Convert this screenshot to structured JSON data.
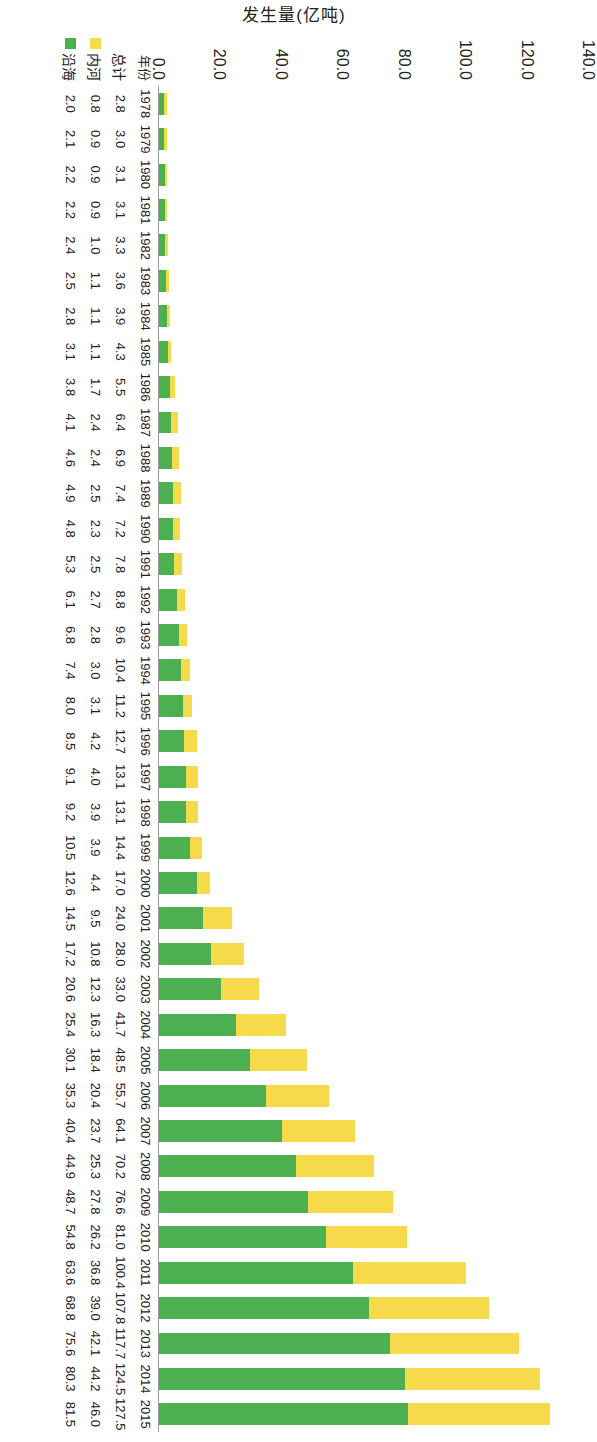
{
  "axis_title": "发生量(亿吨)",
  "y_ticks": [
    "140.0",
    "120.0",
    "100.0",
    "80.0",
    "60.0",
    "40.0",
    "20.0",
    "0.0"
  ],
  "row_labels": {
    "year": "年份",
    "total": "总计",
    "inland": "内河",
    "coastal": "沿海"
  },
  "colors": {
    "inland": "#F7D94C",
    "coastal": "#4CAF50",
    "axis": "#9a9a9a",
    "text": "#222222"
  },
  "chart_data": {
    "type": "bar",
    "title": "",
    "subtitle": "",
    "xlabel": "年份",
    "ylabel": "发生量(亿吨)",
    "ylim": [
      0,
      140
    ],
    "ytick_values": [
      0,
      20,
      40,
      60,
      80,
      100,
      120,
      140
    ],
    "grid": false,
    "stacked": true,
    "orientation": "vertical",
    "legend": [
      "内河",
      "沿海"
    ],
    "legend_position": "bottom-left",
    "categories": [
      "1978",
      "1979",
      "1980",
      "1981",
      "1982",
      "1983",
      "1984",
      "1985",
      "1986",
      "1987",
      "1988",
      "1989",
      "1990",
      "1991",
      "1992",
      "1993",
      "1994",
      "1995",
      "1996",
      "1997",
      "1998",
      "1999",
      "2000",
      "2001",
      "2002",
      "2003",
      "2004",
      "2005",
      "2006",
      "2007",
      "2008",
      "2009",
      "2010",
      "2011",
      "2012",
      "2013",
      "2014",
      "2015"
    ],
    "series": [
      {
        "name": "内河",
        "color": "#F7D94C",
        "values": [
          0.8,
          0.9,
          0.9,
          0.9,
          1.0,
          1.1,
          1.1,
          1.1,
          1.7,
          2.4,
          2.4,
          2.5,
          2.3,
          2.5,
          2.7,
          2.8,
          3.0,
          3.1,
          4.2,
          4.0,
          3.9,
          3.9,
          4.4,
          9.5,
          10.8,
          12.3,
          16.3,
          18.4,
          20.4,
          23.7,
          25.3,
          27.8,
          26.2,
          36.8,
          39.0,
          42.1,
          44.2,
          46.0
        ]
      },
      {
        "name": "沿海",
        "color": "#4CAF50",
        "values": [
          2.0,
          2.1,
          2.2,
          2.2,
          2.4,
          2.5,
          2.8,
          3.1,
          3.8,
          4.1,
          4.6,
          4.9,
          4.8,
          5.3,
          6.1,
          6.8,
          7.4,
          8.0,
          8.5,
          9.1,
          9.2,
          10.5,
          12.6,
          14.5,
          17.2,
          20.6,
          25.4,
          30.1,
          35.3,
          40.4,
          44.9,
          48.7,
          54.8,
          63.6,
          68.8,
          75.6,
          80.3,
          81.5
        ]
      }
    ],
    "totals": [
      2.8,
      3.0,
      3.1,
      3.1,
      3.3,
      3.6,
      3.9,
      4.3,
      5.5,
      6.4,
      6.9,
      7.4,
      7.2,
      7.8,
      8.8,
      9.6,
      10.4,
      11.2,
      12.7,
      13.1,
      13.1,
      14.4,
      17.0,
      24.0,
      28.0,
      33.0,
      41.7,
      48.5,
      55.7,
      64.1,
      70.2,
      76.6,
      81.0,
      100.4,
      107.8,
      117.7,
      124.5,
      127.5
    ],
    "table": {
      "row_headers": [
        "年份",
        "总计",
        "内河",
        "沿海"
      ],
      "rows": [
        [
          "1978",
          "1979",
          "1980",
          "1981",
          "1982",
          "1983",
          "1984",
          "1985",
          "1986",
          "1987",
          "1988",
          "1989",
          "1990",
          "1991",
          "1992",
          "1993",
          "1994",
          "1995",
          "1996",
          "1997",
          "1998",
          "1999",
          "2000",
          "2001",
          "2002",
          "2003",
          "2004",
          "2005",
          "2006",
          "2007",
          "2008",
          "2009",
          "2010",
          "2011",
          "2012",
          "2013",
          "2014",
          "2015"
        ],
        [
          "2.8",
          "3.0",
          "3.1",
          "3.1",
          "3.3",
          "3.6",
          "3.9",
          "4.3",
          "5.5",
          "6.4",
          "6.9",
          "7.4",
          "7.2",
          "7.8",
          "8.8",
          "9.6",
          "10.4",
          "11.2",
          "12.7",
          "13.1",
          "13.1",
          "14.4",
          "17.0",
          "24.0",
          "28.0",
          "33.0",
          "41.7",
          "48.5",
          "55.7",
          "64.1",
          "70.2",
          "76.6",
          "81.0",
          "100.4",
          "107.8",
          "117.7",
          "124.5",
          "127.5"
        ],
        [
          "0.8",
          "0.9",
          "0.9",
          "0.9",
          "1.0",
          "1.1",
          "1.1",
          "1.1",
          "1.7",
          "2.4",
          "2.4",
          "2.5",
          "2.3",
          "2.5",
          "2.7",
          "2.8",
          "3.0",
          "3.1",
          "4.2",
          "4.0",
          "3.9",
          "3.9",
          "4.4",
          "9.5",
          "10.8",
          "12.3",
          "16.3",
          "18.4",
          "20.4",
          "23.7",
          "25.3",
          "27.8",
          "26.2",
          "36.8",
          "39.0",
          "42.1",
          "44.2",
          "46.0"
        ],
        [
          "2.0",
          "2.1",
          "2.2",
          "2.2",
          "2.4",
          "2.5",
          "2.8",
          "3.1",
          "3.8",
          "4.1",
          "4.6",
          "4.9",
          "4.8",
          "5.3",
          "6.1",
          "6.8",
          "7.4",
          "8.0",
          "8.5",
          "9.1",
          "9.2",
          "10.5",
          "12.6",
          "14.5",
          "17.2",
          "20.6",
          "25.4",
          "30.1",
          "35.3",
          "40.4",
          "44.9",
          "48.7",
          "54.8",
          "63.6",
          "68.8",
          "75.6",
          "80.3",
          "81.5"
        ]
      ]
    }
  }
}
